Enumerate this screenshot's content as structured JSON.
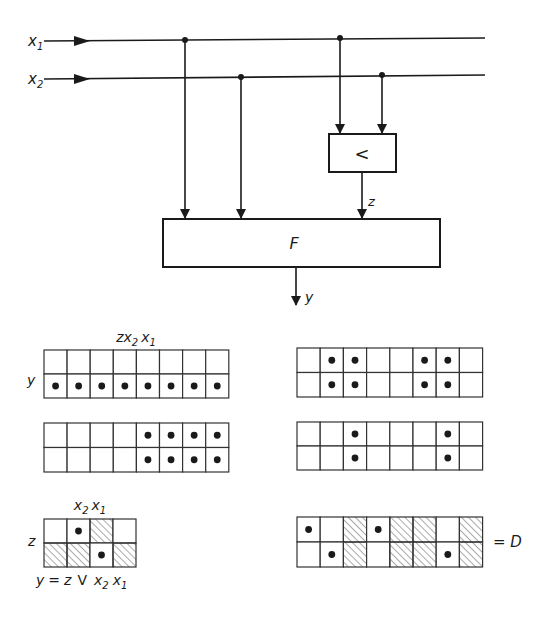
{
  "circuit": {
    "inputs": [
      {
        "name": "x",
        "sub": "1"
      },
      {
        "name": "x",
        "sub": "2"
      }
    ],
    "comparator_label": "<",
    "comparator_output": "z",
    "function_block_label": "F",
    "output_label": "y"
  },
  "tables": {
    "header_main": {
      "a": "z",
      "b": "x",
      "b_sub": "2",
      "c": "x",
      "c_sub": "1"
    },
    "row_label_y": "y",
    "grid_top_left": {
      "rows": [
        [
          0,
          0,
          0,
          0,
          0,
          0,
          0,
          0
        ],
        [
          1,
          1,
          1,
          1,
          1,
          1,
          1,
          1
        ]
      ]
    },
    "grid_mid_left": {
      "rows": [
        [
          0,
          0,
          0,
          0,
          1,
          1,
          1,
          1
        ],
        [
          0,
          0,
          0,
          0,
          1,
          1,
          1,
          1
        ]
      ]
    },
    "grid_top_right": {
      "rows": [
        [
          0,
          1,
          1,
          0,
          0,
          1,
          1,
          0
        ],
        [
          0,
          1,
          1,
          0,
          0,
          1,
          1,
          0
        ]
      ]
    },
    "grid_mid_right": {
      "rows": [
        [
          0,
          0,
          1,
          0,
          0,
          0,
          1,
          0
        ],
        [
          0,
          0,
          1,
          0,
          0,
          0,
          1,
          0
        ]
      ]
    },
    "kmap": {
      "header": {
        "b": "x",
        "b_sub": "2",
        "c": "x",
        "c_sub": "1"
      },
      "row_label": "z",
      "dots": [
        [
          0,
          1,
          0,
          0
        ],
        [
          0,
          0,
          1,
          0
        ]
      ],
      "hatched": [
        [
          0,
          0,
          1,
          0
        ],
        [
          1,
          1,
          0,
          1
        ]
      ],
      "formula": {
        "lhs": "y",
        "eq": "=",
        "z": "z",
        "or": "V",
        "b": "x",
        "b_sub": "2",
        "c": "x",
        "c_sub": "1"
      }
    },
    "grid_d": {
      "dots": [
        [
          1,
          0,
          0,
          1,
          0,
          0,
          0,
          0
        ],
        [
          0,
          1,
          0,
          0,
          0,
          0,
          1,
          0
        ]
      ],
      "hatched": [
        [
          0,
          0,
          1,
          0,
          1,
          1,
          0,
          1
        ],
        [
          0,
          0,
          1,
          0,
          1,
          1,
          0,
          1
        ]
      ],
      "label": "= D"
    }
  }
}
